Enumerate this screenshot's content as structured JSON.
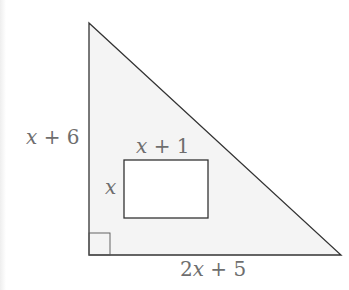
{
  "diagram": {
    "type": "geometry",
    "colors": {
      "stroke": "#333333",
      "triangle_fill": "#f4f4f4",
      "rectangle_fill": "#ffffff",
      "label": "#6e6e6e"
    },
    "triangle": {
      "vertices": [
        [
          89,
          23
        ],
        [
          89,
          255
        ],
        [
          341,
          255
        ]
      ],
      "right_angle_at": "bottom-left",
      "labels": {
        "vertical_leg": {
          "var": "x",
          "rest": " + 6"
        },
        "horizontal_leg": {
          "coef": "2",
          "var": "x",
          "rest": " + 5"
        }
      }
    },
    "rectangle": {
      "x": 124,
      "y": 160,
      "width": 84,
      "height": 58,
      "labels": {
        "width": {
          "var": "x",
          "rest": " + 1"
        },
        "height": {
          "var": "x"
        }
      }
    }
  }
}
